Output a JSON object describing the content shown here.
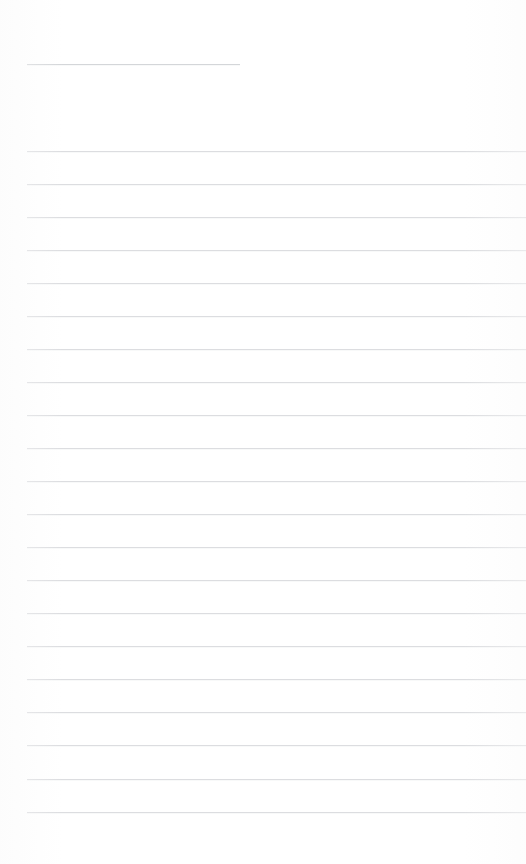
{
  "page": {
    "kind": "ruled-paper",
    "width": 526,
    "height": 864,
    "background_color": "#ffffff",
    "is_blank": true,
    "content_text": ""
  },
  "ink": {
    "rule_color": "#dcdde0",
    "header_rule_color": "#d4d6d9",
    "rule_thickness_px": 1
  },
  "header_rule": {
    "name": "title-rule",
    "label": "",
    "x_start": 27,
    "x_end": 240,
    "y": 64
  },
  "body_rules": {
    "count": 21,
    "x_start": 27,
    "x_end": 526,
    "first_y": 151,
    "spacing_px": 33,
    "lines": [
      {
        "index": 1,
        "y": 151,
        "text": ""
      },
      {
        "index": 2,
        "y": 184,
        "text": ""
      },
      {
        "index": 3,
        "y": 217,
        "text": ""
      },
      {
        "index": 4,
        "y": 250,
        "text": ""
      },
      {
        "index": 5,
        "y": 283,
        "text": ""
      },
      {
        "index": 6,
        "y": 316,
        "text": ""
      },
      {
        "index": 7,
        "y": 349,
        "text": ""
      },
      {
        "index": 8,
        "y": 382,
        "text": ""
      },
      {
        "index": 9,
        "y": 415,
        "text": ""
      },
      {
        "index": 10,
        "y": 448,
        "text": ""
      },
      {
        "index": 11,
        "y": 481,
        "text": ""
      },
      {
        "index": 12,
        "y": 514,
        "text": ""
      },
      {
        "index": 13,
        "y": 547,
        "text": ""
      },
      {
        "index": 14,
        "y": 580,
        "text": ""
      },
      {
        "index": 15,
        "y": 613,
        "text": ""
      },
      {
        "index": 16,
        "y": 646,
        "text": ""
      },
      {
        "index": 17,
        "y": 679,
        "text": ""
      },
      {
        "index": 18,
        "y": 712,
        "text": ""
      },
      {
        "index": 19,
        "y": 745,
        "text": ""
      },
      {
        "index": 20,
        "y": 779,
        "text": ""
      },
      {
        "index": 21,
        "y": 812,
        "text": ""
      }
    ]
  },
  "margins": {
    "top_blank_px": 64,
    "left_px": 27,
    "bottom_blank_px": 52
  }
}
